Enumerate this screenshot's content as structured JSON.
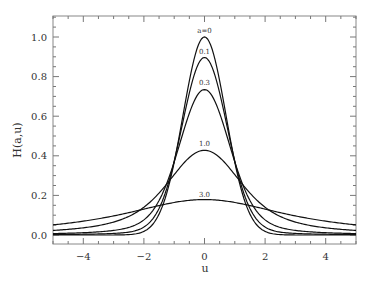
{
  "chart_data": {
    "type": "line",
    "title": "",
    "xlabel": "u",
    "ylabel": "H(a,u)",
    "xlim": [
      -5,
      5
    ],
    "ylim": [
      -0.05,
      1.1
    ],
    "grid": false,
    "legend": "inline labels at curve peaks",
    "x_ticks": [
      -4,
      -2,
      0,
      2,
      4
    ],
    "x_tick_labels": [
      "−4",
      "−2",
      "0",
      "2",
      "4"
    ],
    "y_ticks": [
      0.0,
      0.2,
      0.4,
      0.6,
      0.8,
      1.0
    ],
    "y_tick_labels": [
      "0.0",
      "0.2",
      "0.4",
      "0.6",
      "0.8",
      "1.0"
    ],
    "x": [
      -5,
      -4,
      -3,
      -2,
      -1.5,
      -1,
      -0.5,
      0,
      0.5,
      1,
      1.5,
      2,
      3,
      4,
      5
    ],
    "series": [
      {
        "name": "a=0",
        "label": "a=0",
        "peak": 1.0,
        "values": [
          0.0,
          0.0,
          0.0001,
          0.018,
          0.105,
          0.368,
          0.779,
          1.0,
          0.779,
          0.368,
          0.105,
          0.018,
          0.0001,
          0.0,
          0.0
        ]
      },
      {
        "name": "a=0.1",
        "label": "0.1",
        "peak": 0.896,
        "values": [
          0.0023,
          0.0036,
          0.0066,
          0.026,
          0.104,
          0.346,
          0.708,
          0.896,
          0.708,
          0.346,
          0.104,
          0.026,
          0.0066,
          0.0036,
          0.0023
        ]
      },
      {
        "name": "a=0.3",
        "label": "0.3",
        "peak": 0.735,
        "values": [
          0.0069,
          0.011,
          0.019,
          0.046,
          0.112,
          0.307,
          0.586,
          0.735,
          0.586,
          0.307,
          0.112,
          0.046,
          0.019,
          0.011,
          0.0069
        ]
      },
      {
        "name": "a=1.0",
        "label": "1.0",
        "peak": 0.428,
        "values": [
          0.022,
          0.034,
          0.057,
          0.11,
          0.169,
          0.275,
          0.374,
          0.428,
          0.374,
          0.275,
          0.169,
          0.11,
          0.057,
          0.034,
          0.022
        ]
      },
      {
        "name": "a=3.0",
        "label": "3.0",
        "peak": 0.179,
        "values": [
          0.053,
          0.073,
          0.101,
          0.136,
          0.153,
          0.167,
          0.176,
          0.179,
          0.176,
          0.167,
          0.153,
          0.136,
          0.101,
          0.073,
          0.053
        ]
      }
    ],
    "a_values": [
      0,
      0.1,
      0.3,
      1.0,
      3.0
    ]
  }
}
